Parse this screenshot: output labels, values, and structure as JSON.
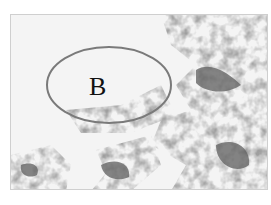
{
  "figure": {
    "region_label": "B",
    "ellipse_color": "#7a7a7a",
    "dark_terrain_color": "#5a5a5a",
    "mid_terrain_color": "#8c8c8c",
    "background_color": "#f4f4f4"
  }
}
